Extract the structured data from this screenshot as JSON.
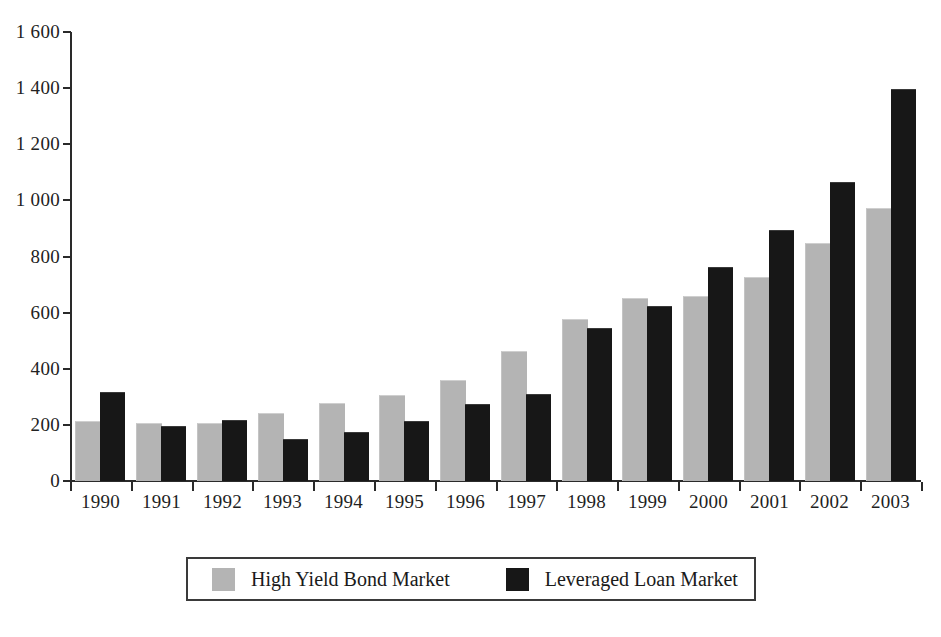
{
  "chart_data": {
    "type": "bar",
    "title": "",
    "subtitle": "",
    "xlabel": "",
    "ylabel": "",
    "categories": [
      "1990",
      "1991",
      "1992",
      "1993",
      "1994",
      "1995",
      "1996",
      "1997",
      "1998",
      "1999",
      "2000",
      "2001",
      "2002",
      "2003"
    ],
    "series": [
      {
        "name": "High Yield Bond Market",
        "color": "#b4b4b4",
        "values": [
          210,
          203,
          202,
          240,
          273,
          303,
          355,
          458,
          572,
          647,
          655,
          725,
          845,
          970
        ]
      },
      {
        "name": "Leveraged Loan Market",
        "color": "#171717",
        "values": [
          315,
          192,
          213,
          147,
          172,
          209,
          270,
          305,
          540,
          619,
          760,
          890,
          1062,
          1392
        ]
      }
    ],
    "ylim": [
      0,
      1600
    ],
    "yticks": [
      0,
      200,
      400,
      600,
      800,
      1000,
      1200,
      1400,
      1600
    ],
    "ytick_labels": [
      "0",
      "200",
      "400",
      "600",
      "800",
      "1 000",
      "1 200",
      "1 400",
      "1 600"
    ],
    "grid": false,
    "legend_position": "bottom"
  },
  "legend": {
    "items": [
      {
        "label": "High Yield Bond Market",
        "swatch": "gray"
      },
      {
        "label": "Leveraged Loan Market",
        "swatch": "black"
      }
    ]
  },
  "caption": {
    "text": ""
  }
}
